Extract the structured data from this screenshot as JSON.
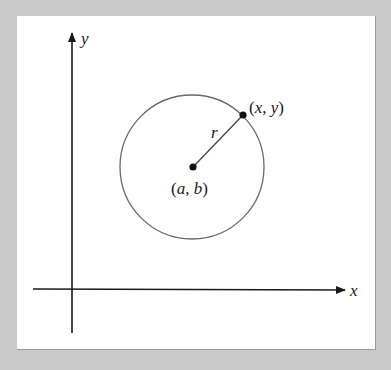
{
  "diagram": {
    "type": "circle-on-cartesian-plane",
    "axes": {
      "x_label": "x",
      "y_label": "y"
    },
    "circle": {
      "center_label_open": "(",
      "center_label_a": "a",
      "center_label_sep": ", ",
      "center_label_b": "b",
      "center_label_close": ")",
      "radius_label": "r",
      "point_label_open": "(",
      "point_label_x": "x",
      "point_label_sep": ", ",
      "point_label_y": "y",
      "point_label_close": ")"
    },
    "colors": {
      "background": "#c9c9c9",
      "panel": "#ffffff",
      "axis": "#1a1a1a",
      "circle": "#6a6a6a",
      "point": "#111111"
    }
  }
}
